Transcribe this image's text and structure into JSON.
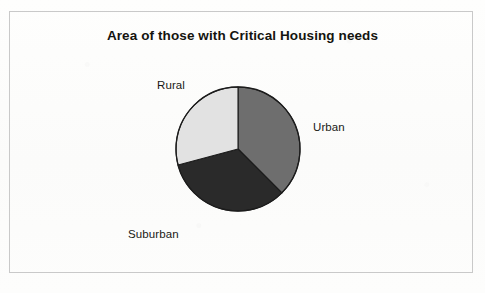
{
  "page": {
    "background_color": "#fdfdfc",
    "frame_color": "#c9c9c9"
  },
  "chart_data": {
    "type": "pie",
    "title": "Area of those with Critical Housing needs",
    "xlabel": "",
    "ylabel": "",
    "legend_position": "none",
    "labels_position": "outside",
    "grid": false,
    "categories": [
      "Urban",
      "Suburban",
      "Rural"
    ],
    "values": [
      37.5,
      33.3,
      29.2
    ],
    "units": "percent",
    "start_angle_deg": 0,
    "direction": "clockwise",
    "slices": [
      {
        "label": "Urban",
        "value": 37.5,
        "color": "#6e6e6e",
        "start_angle_deg": 0,
        "end_angle_deg": 135
      },
      {
        "label": "Suburban",
        "value": 33.3,
        "color": "#2a2a2a",
        "start_angle_deg": 135,
        "end_angle_deg": 255
      },
      {
        "label": "Rural",
        "value": 29.2,
        "color": "#e2e2e2",
        "start_angle_deg": 255,
        "end_angle_deg": 360
      }
    ],
    "geometry": {
      "center_x": 238,
      "center_y": 149,
      "radius": 62,
      "outline_color": "#1c1c1c"
    }
  }
}
